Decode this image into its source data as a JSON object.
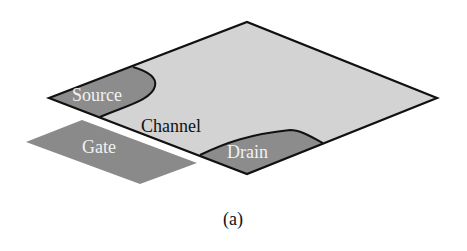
{
  "figure": {
    "caption": "(a)",
    "colors": {
      "channel_fill": "#d3d3d3",
      "region_fill": "#8c8c8c",
      "gate_fill": "#8a8a8a",
      "outline": "#111111",
      "label_light": "#f2f2f2",
      "label_dark": "#111111"
    },
    "labels": {
      "source": "Source",
      "channel": "Channel",
      "drain": "Drain",
      "gate": "Gate"
    }
  }
}
